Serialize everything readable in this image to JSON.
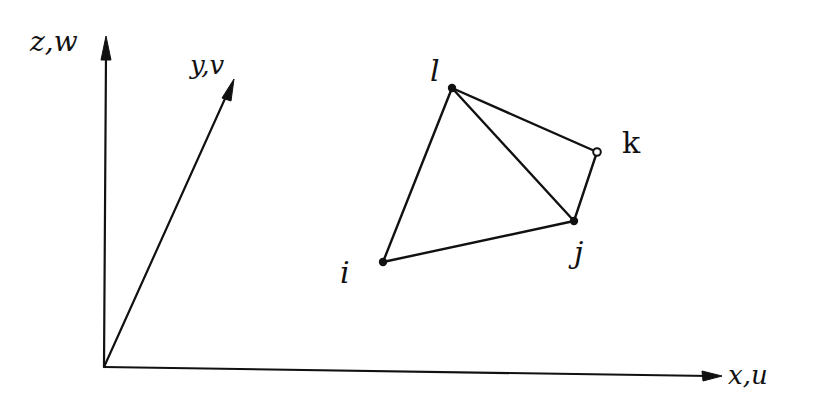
{
  "diagram": {
    "type": "tetrahedral element in 3D coordinate system (hand-drawn)",
    "colors": {
      "ink": "#111111",
      "background": "#ffffff"
    },
    "axes": {
      "x": {
        "label": "x,u",
        "origin": [
          104,
          367
        ],
        "tip": [
          722,
          376
        ]
      },
      "y": {
        "label": "y,v",
        "origin": [
          104,
          367
        ],
        "tip": [
          234,
          79
        ]
      },
      "z": {
        "label": "z,w",
        "origin": [
          104,
          367
        ],
        "tip": [
          106,
          36
        ]
      }
    },
    "nodes": [
      {
        "id": "i",
        "label": "i",
        "pos": [
          383,
          262
        ],
        "marker": "filled"
      },
      {
        "id": "j",
        "label": "j",
        "pos": [
          574,
          221
        ],
        "marker": "filled"
      },
      {
        "id": "k",
        "label": "k",
        "pos": [
          597,
          152
        ],
        "marker": "hollow"
      },
      {
        "id": "l",
        "label": "l",
        "pos": [
          452,
          88
        ],
        "marker": "filled"
      }
    ],
    "edges": [
      [
        "i",
        "j"
      ],
      [
        "i",
        "l"
      ],
      [
        "j",
        "l"
      ],
      [
        "j",
        "k"
      ],
      [
        "k",
        "l"
      ]
    ]
  }
}
